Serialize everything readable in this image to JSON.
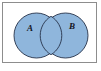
{
  "figure": {
    "kind": "venn-diagram",
    "set_count": 2,
    "background_color": "#ffffff",
    "frame": {
      "visible": true,
      "border_color": "#8d8d8d",
      "fill_color": "#ffffff"
    },
    "style": {
      "circle_fill": "#8fb6dc",
      "circle_stroke": "#26324a",
      "label_color": "#15151c"
    },
    "sets": [
      {
        "id": "A",
        "label": "A",
        "label_position": "left",
        "fill_color": "#8fb6dc",
        "stroke_color": "#26324a"
      },
      {
        "id": "B",
        "label": "B",
        "label_position": "right",
        "fill_color": "#8fb6dc",
        "stroke_color": "#26324a"
      }
    ],
    "intersection": {
      "shaded": true,
      "fill_color": "#8fb6dc",
      "label": ""
    }
  }
}
